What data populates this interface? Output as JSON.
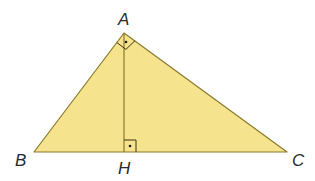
{
  "diagram": {
    "type": "right-triangle-with-altitude",
    "colors": {
      "fill": "#f6e38e",
      "stroke": "#8a7a2a",
      "label": "#2a2a2a"
    },
    "vertices": {
      "A": {
        "label": "A",
        "x": 124,
        "y": 33
      },
      "B": {
        "label": "B",
        "x": 34,
        "y": 152
      },
      "C": {
        "label": "C",
        "x": 287,
        "y": 152
      },
      "H": {
        "label": "H",
        "x": 124,
        "y": 152
      }
    },
    "segments": [
      "AB",
      "AC",
      "BC",
      "AH"
    ],
    "right_angles": [
      {
        "at": "A",
        "between": [
          "AB",
          "AC"
        ]
      },
      {
        "at": "H",
        "between": [
          "AH",
          "HC"
        ]
      }
    ]
  }
}
